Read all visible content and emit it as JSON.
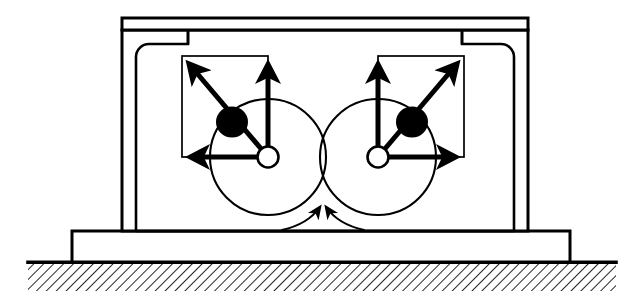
{
  "figure": {
    "background_color": "#ffffff",
    "line_color": "#000000",
    "mass_fill_color": "#000000"
  },
  "canvas": {
    "width": 644,
    "height": 307
  },
  "housing": {
    "label": "machine housing",
    "lid": {
      "x": 122,
      "y": 18,
      "width": 406,
      "height": 12
    },
    "body": {
      "x": 122,
      "y": 30,
      "width": 406,
      "height": 201
    },
    "inner_cavity": {
      "x": 136,
      "y": 44,
      "width": 378,
      "height": 187,
      "corner_radius": 13
    },
    "notch_left": {
      "x": 136,
      "y": 30,
      "width": 52,
      "height": 14
    },
    "notch_right": {
      "x": 462,
      "y": 30,
      "width": 52,
      "height": 14
    },
    "wall_thickness": 14
  },
  "base_plate": {
    "label": "base plate",
    "x": 72,
    "y": 231,
    "width": 498,
    "height": 31
  },
  "ground": {
    "label": "ground surface",
    "line_y": 262,
    "x_start": 28,
    "x_end": 616,
    "hatch_depth": 28,
    "hatch_angle_deg": 45,
    "hatch_spacing": 7
  },
  "rotors": [
    {
      "id": "left-rotor",
      "label": "left eccentric rotor",
      "rotation": "counter-clockwise",
      "shaft_center": {
        "x": 268,
        "y": 157
      },
      "shaft_radius": 10,
      "orbit_radius": 58,
      "mass": {
        "x": 232,
        "y": 122,
        "radius": 15,
        "label": "eccentric mass"
      },
      "vector_box": {
        "x": 182,
        "y": 56,
        "width": 86,
        "height": 101
      },
      "vectors": [
        {
          "id": "resultant",
          "label": "resultant centrifugal force",
          "from": {
            "x": 268,
            "y": 157
          },
          "to": {
            "x": 183,
            "y": 57
          }
        },
        {
          "id": "vertical",
          "label": "vertical force component",
          "from": {
            "x": 268,
            "y": 157
          },
          "to": {
            "x": 268,
            "y": 57
          }
        },
        {
          "id": "horizontal",
          "label": "horizontal force component",
          "from": {
            "x": 268,
            "y": 157
          },
          "to": {
            "x": 183,
            "y": 157
          }
        }
      ]
    },
    {
      "id": "right-rotor",
      "label": "right eccentric rotor",
      "rotation": "clockwise",
      "shaft_center": {
        "x": 378,
        "y": 157
      },
      "shaft_radius": 10,
      "orbit_radius": 58,
      "mass": {
        "x": 412,
        "y": 122,
        "radius": 15,
        "label": "eccentric mass"
      },
      "vector_box": {
        "x": 378,
        "y": 56,
        "width": 86,
        "height": 101
      },
      "vectors": [
        {
          "id": "resultant",
          "label": "resultant centrifugal force",
          "from": {
            "x": 378,
            "y": 157
          },
          "to": {
            "x": 463,
            "y": 57
          }
        },
        {
          "id": "vertical",
          "label": "vertical force component",
          "from": {
            "x": 378,
            "y": 157
          },
          "to": {
            "x": 378,
            "y": 57
          }
        },
        {
          "id": "horizontal",
          "label": "horizontal force component",
          "from": {
            "x": 378,
            "y": 157
          },
          "to": {
            "x": 463,
            "y": 157
          }
        }
      ]
    }
  ],
  "rotation_arrows": [
    {
      "id": "left-rotation-arrow",
      "label": "left rotor direction of rotation",
      "path": "M 283 229 C 300 225 312 216 320 207",
      "head_at": {
        "x": 321,
        "y": 205
      },
      "head_angle_deg": -52
    },
    {
      "id": "right-rotation-arrow",
      "label": "right rotor direction of rotation",
      "path": "M 363 229 C 346 225 334 216 326 207",
      "head_at": {
        "x": 325,
        "y": 205
      },
      "head_angle_deg": 232
    }
  ],
  "stroke_widths": {
    "housing_outline": 3,
    "cavity_outline": 2.2,
    "rotor_circle": 2,
    "shaft_circle": 2.4,
    "vector_box": 1.6,
    "vector_arrow": 5,
    "rotation_arrow": 2,
    "ground_line": 3.5,
    "hatch": 1.6
  }
}
